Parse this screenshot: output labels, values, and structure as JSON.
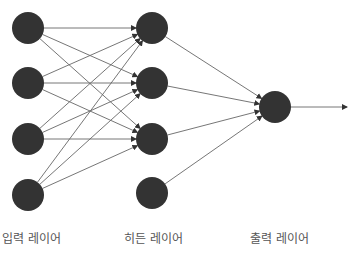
{
  "diagram": {
    "colors": {
      "node": "#333333",
      "edge": "#666666",
      "label": "#555555"
    },
    "layers": [
      {
        "name": "input",
        "label": "입력 레이어",
        "x": 28,
        "nodes_y": [
          28,
          83,
          139,
          195
        ]
      },
      {
        "name": "hidden",
        "label": "히든 레이어",
        "x": 152,
        "nodes_y": [
          28,
          83,
          139,
          193
        ]
      },
      {
        "name": "output",
        "label": "출력 레이어",
        "x": 275,
        "nodes_y": [
          107
        ]
      }
    ],
    "node_radius": 16,
    "input_to_hidden_targets": [
      0,
      1,
      2
    ],
    "hidden_to_output_sources": [
      0,
      1,
      2,
      3
    ],
    "output_arrow_end_x": 347
  }
}
